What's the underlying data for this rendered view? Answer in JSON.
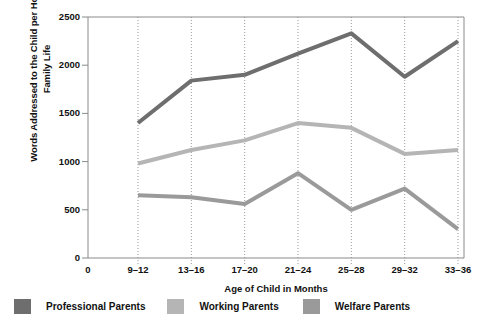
{
  "chart_data": {
    "type": "line",
    "title": "",
    "xlabel": "Age of Child in Months",
    "ylabel": "Words Addressed to the Child per Hour of Family Life",
    "categories": [
      "9–12",
      "13–16",
      "17–20",
      "21–24",
      "25–28",
      "29–32",
      "33–36"
    ],
    "x_axis_origin_label": "0",
    "xtick_labels": [
      "0",
      "9–12",
      "13–16",
      "17–20",
      "21–24",
      "25–28",
      "29–32",
      "33–36"
    ],
    "ytick_labels": [
      "0",
      "500",
      "1000",
      "1500",
      "2000",
      "2500"
    ],
    "ytick_values": [
      0,
      500,
      1000,
      1500,
      2000,
      2500
    ],
    "ylim": [
      0,
      2500
    ],
    "grid": "vertical-dotted",
    "legend_position": "below-plot",
    "series": [
      {
        "name": "Professional Parents",
        "color": "#6e6e6e",
        "values": [
          1400,
          1840,
          1900,
          2120,
          2330,
          1880,
          2250
        ]
      },
      {
        "name": "Working Parents",
        "color": "#b5b5b5",
        "values": [
          980,
          1120,
          1220,
          1400,
          1350,
          1080,
          1120
        ]
      },
      {
        "name": "Welfare Parents",
        "color": "#9a9a9a",
        "values": [
          650,
          630,
          560,
          880,
          500,
          720,
          300
        ]
      }
    ]
  },
  "legend": {
    "items": [
      {
        "label": "Professional Parents",
        "color": "#6e6e6e"
      },
      {
        "label": "Working Parents",
        "color": "#b5b5b5"
      },
      {
        "label": "Welfare Parents",
        "color": "#9a9a9a"
      }
    ]
  },
  "colors": {
    "professional": "#6e6e6e",
    "working": "#b5b5b5",
    "welfare": "#9a9a9a",
    "axis": "#8a8a8a",
    "grid": "#9a9a9a",
    "text": "#111111",
    "background": "#ffffff"
  }
}
